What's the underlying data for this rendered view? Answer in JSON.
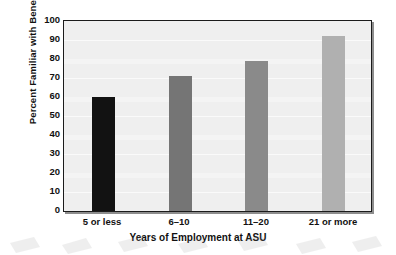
{
  "chart_data": {
    "type": "bar",
    "title": "",
    "subtitle": "",
    "xlabel": "Years of Employment at ASU",
    "ylabel": "Percent Familiar with Benefit",
    "categories": [
      "5 or less",
      "6–10",
      "11–20",
      "21 or more"
    ],
    "values": [
      60,
      71,
      79,
      92
    ],
    "bar_colors": [
      "#121212",
      "#757575",
      "#8a8a8a",
      "#b0b0b0"
    ],
    "ylim": [
      0,
      100
    ],
    "yticks": [
      0,
      10,
      20,
      30,
      40,
      50,
      60,
      70,
      80,
      90,
      100
    ],
    "ytick_labels": [
      "0",
      "10",
      "20",
      "30",
      "40",
      "50",
      "60",
      "70",
      "80",
      "90",
      "100"
    ],
    "grid": true,
    "grid_axis": "y",
    "legend": false,
    "legend_position": "none",
    "plot_background": "#efefef",
    "gridline_color": "#fafafa",
    "axis_color": "#1b1b1b",
    "page_background": "#ffffff",
    "text_color": "#111111"
  }
}
